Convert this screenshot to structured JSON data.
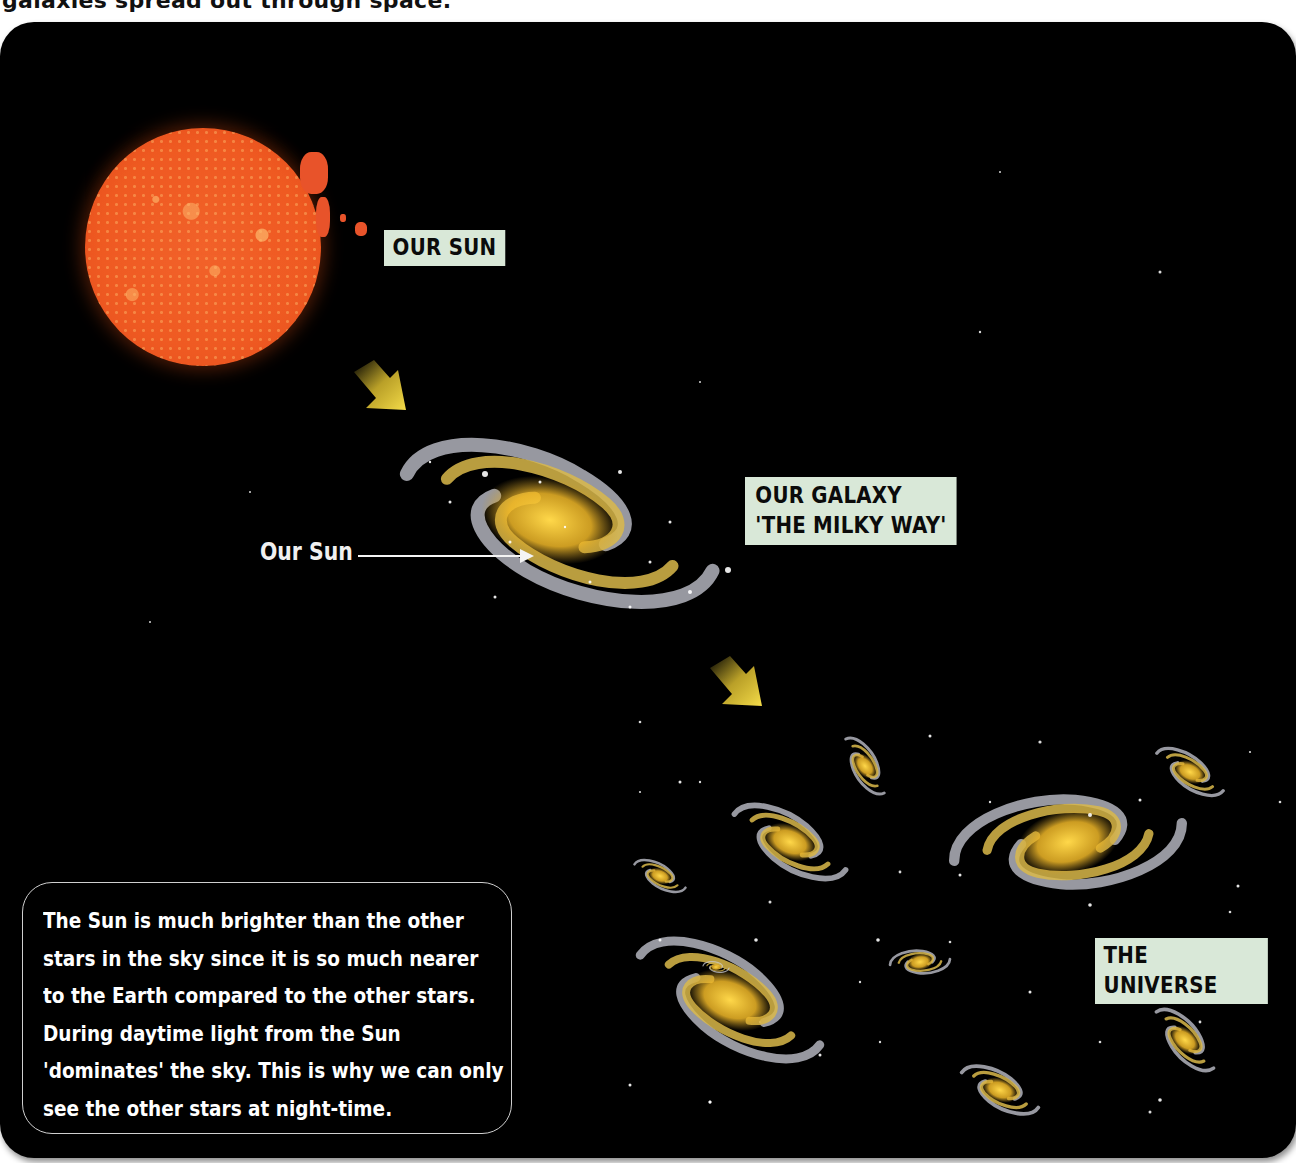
{
  "caption": "galaxies spread out through space.",
  "labels": {
    "sun": "OUR SUN",
    "galaxy_line1": "OUR GALAXY",
    "galaxy_line2": "'THE MILKY WAY'",
    "universe": "THE UNIVERSE"
  },
  "pointer": {
    "text": "Our Sun"
  },
  "info_box": {
    "lines": [
      "The Sun is much brighter than the other",
      "stars in the sky since it is so much nearer",
      "to the Earth compared to the other stars.",
      "During daytime light from the Sun",
      "'dominates' the sky. This is why we can only",
      "see the other stars at night-time."
    ]
  },
  "colors": {
    "panel_bg": "#000000",
    "label_bg": "#d9e8d8",
    "sun": "#ef5a22",
    "arrow": "#f2d43a",
    "galaxy_core": "#f5c02a",
    "galaxy_arm": "#c9cbd6"
  },
  "icons": {
    "arrow_1": "down-right-arrow",
    "arrow_2": "down-right-arrow"
  }
}
